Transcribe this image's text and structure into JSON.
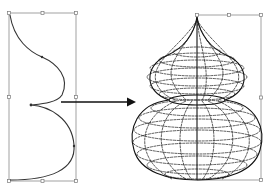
{
  "diagram": {
    "title": "",
    "colors": {
      "background": "#ffffff",
      "frame": "#8a8a8a",
      "curve": "#333333",
      "wireframe": "#1a1a1a",
      "arrow": "#111111"
    },
    "left_panel": {
      "name": "profile-curve",
      "bounding_box": {
        "x": 9,
        "y": 13,
        "width": 67,
        "height": 168
      },
      "nodes": [
        "top",
        "upper-bulge",
        "waist",
        "lower-bulge",
        "bottom"
      ]
    },
    "arrow": {
      "from": [
        61,
        102
      ],
      "to": [
        135,
        102
      ],
      "meaning": "revolve"
    },
    "right_panel": {
      "name": "revolved-wireframe",
      "bounding_box": {
        "x": 197,
        "y": 15,
        "width": 64,
        "height": 165
      },
      "upper_bulb": {
        "cx": 197,
        "cy": 77,
        "rx": 50,
        "ry": 24
      },
      "lower_bulb": {
        "cx": 197,
        "cy": 140,
        "rx": 64,
        "ry": 40
      },
      "neck": {
        "y": 100,
        "half_width": 28
      },
      "tip": {
        "x": 197,
        "y": 15
      }
    }
  }
}
